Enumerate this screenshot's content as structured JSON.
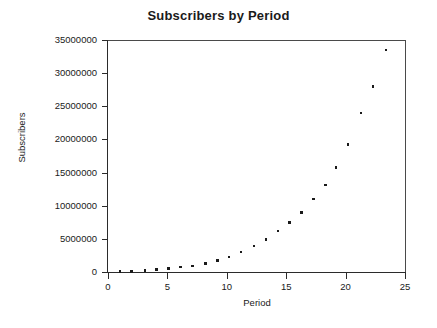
{
  "chart_data": {
    "type": "scatter",
    "title": "Subscribers by Period",
    "xlabel": "Period",
    "ylabel": "Subscribers",
    "xlim": [
      0,
      25
    ],
    "ylim": [
      0,
      35000000
    ],
    "grid": false,
    "legend": null,
    "xticks": [
      0,
      5,
      10,
      15,
      20,
      25
    ],
    "xtick_labels": [
      "0",
      "5",
      "10",
      "15",
      "20",
      "25"
    ],
    "yticks": [
      0,
      5000000,
      10000000,
      15000000,
      20000000,
      25000000,
      30000000,
      35000000
    ],
    "ytick_labels": [
      "0",
      "5000000",
      "10000000",
      "15000000",
      "20000000",
      "25000000",
      "30000000",
      "35000000"
    ],
    "marker": "square",
    "marker_color": "#1a1a1a",
    "series": [
      {
        "name": "Subscribers",
        "x": [
          1.0,
          2.0,
          3.1,
          4.1,
          5.1,
          6.1,
          7.1,
          8.2,
          9.2,
          10.2,
          11.2,
          12.3,
          13.3,
          14.3,
          15.3,
          16.3,
          17.3,
          18.3,
          19.2,
          20.2,
          21.3,
          22.3,
          23.4
        ],
        "y": [
          60000,
          110000,
          210000,
          340000,
          560000,
          780000,
          900000,
          1250000,
          1700000,
          2250000,
          3000000,
          3900000,
          4900000,
          6200000,
          7500000,
          9000000,
          13100000,
          15800000,
          19200000,
          24000000,
          28000000,
          33500000,
          33500000
        ],
        "values": [
          60000,
          110000,
          210000,
          340000,
          560000,
          780000,
          900000,
          1250000,
          1700000,
          2250000,
          3000000,
          3900000,
          4900000,
          6200000,
          7500000,
          9000000,
          11000000,
          13100000,
          15800000,
          19200000,
          24000000,
          28000000,
          33500000
        ]
      }
    ]
  }
}
